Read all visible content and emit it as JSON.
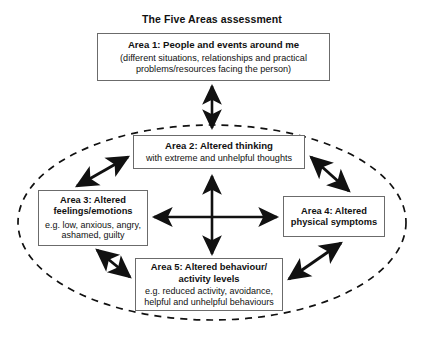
{
  "title": "The Five Areas assessment",
  "colors": {
    "background": "#ffffff",
    "text": "#111111",
    "box_border": "#6b6b6b",
    "arrow": "#111111",
    "ellipse": "#111111"
  },
  "boxes": {
    "area1": {
      "heading": "Area 1: People and events around me",
      "detail": "(different situations, relationships and practical problems/resources facing the person)"
    },
    "area2": {
      "heading": "Area 2: Altered thinking",
      "detail": "with extreme and unhelpful thoughts"
    },
    "area3": {
      "heading": "Area 3: Altered feelings/emotions",
      "detail": "e.g. low, anxious, angry, ashamed, guilty"
    },
    "area4": {
      "heading": "Area 4: Altered physical symptoms",
      "detail": ""
    },
    "area5": {
      "heading": "Area 5: Altered behaviour/ activity levels",
      "detail": "e.g. reduced activity, avoidance, helpful and unhelpful behaviours"
    }
  },
  "connectors": [
    {
      "name": "area1-area2",
      "style": "double-arrow",
      "orientation": "vertical"
    },
    {
      "name": "area2-area5",
      "style": "double-arrow",
      "orientation": "vertical"
    },
    {
      "name": "area3-area4",
      "style": "double-arrow",
      "orientation": "horizontal"
    },
    {
      "name": "area3-area2",
      "style": "double-arrow",
      "orientation": "diagonal"
    },
    {
      "name": "area2-area4",
      "style": "double-arrow",
      "orientation": "diagonal"
    },
    {
      "name": "area3-area5",
      "style": "double-arrow",
      "orientation": "diagonal"
    },
    {
      "name": "area5-area4",
      "style": "double-arrow",
      "orientation": "diagonal"
    }
  ],
  "enclosure": {
    "name": "dashed-ellipse",
    "style": "dashed",
    "encloses": [
      "area2",
      "area3",
      "area4",
      "area5"
    ]
  }
}
